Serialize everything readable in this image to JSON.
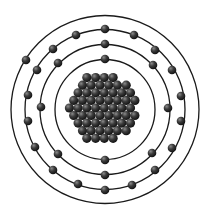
{
  "diagram": {
    "type": "bohr-atom-model",
    "center": [
      105,
      109.5
    ],
    "colors": {
      "background": "#ffffff",
      "orbit": "#1a1a1a",
      "electron": "#2a2a2a",
      "nucleon": "#3a3a3a"
    },
    "shells": [
      {
        "name": "shell-1",
        "radius": 50,
        "electrons": [
          [
            105,
            59
          ],
          [
            105,
            160
          ]
        ]
      },
      {
        "name": "shell-2",
        "radius": 65,
        "electrons": [
          [
            105,
            44
          ],
          [
            58,
            63
          ],
          [
            153,
            65
          ],
          [
            41,
            107
          ],
          [
            168,
            108
          ],
          [
            58,
            154
          ],
          [
            152,
            153
          ],
          [
            105,
            175
          ]
        ]
      },
      {
        "name": "shell-3",
        "radius": 80,
        "electrons": [
          [
            105,
            29
          ],
          [
            76,
            35
          ],
          [
            134,
            35
          ],
          [
            53,
            49
          ],
          [
            155,
            50
          ],
          [
            37,
            70
          ],
          [
            172,
            70
          ],
          [
            28,
            95
          ],
          [
            181,
            96
          ],
          [
            28,
            121
          ],
          [
            181,
            121
          ],
          [
            35,
            147
          ],
          [
            172,
            148
          ],
          [
            53,
            170
          ],
          [
            155,
            170
          ],
          [
            78,
            184
          ],
          [
            132,
            185
          ],
          [
            105,
            190
          ]
        ]
      },
      {
        "name": "shell-4",
        "radius": 94,
        "electrons": [
          [
            26,
            60
          ]
        ]
      }
    ],
    "nucleus": {
      "center": [
        103,
        108
      ],
      "radius": 38,
      "particle_radius": 4.6
    }
  }
}
